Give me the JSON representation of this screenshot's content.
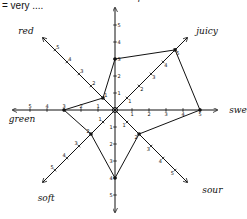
{
  "title": "= very ....",
  "chart_data": {
    "type": "radar",
    "title": "= very ....",
    "axes": [
      "crisp",
      "juicy",
      "sweet",
      "sour",
      "crunchy",
      "soft",
      "green",
      "red"
    ],
    "values": [
      3,
      5,
      5,
      2,
      4,
      2,
      3,
      1
    ],
    "range": [
      0,
      5
    ],
    "ticks": [
      1,
      2,
      3,
      4,
      5
    ],
    "grid": false,
    "legend": "none",
    "style": "hand-drawn"
  },
  "colors": {
    "ink": "#111111",
    "background": "#ffffff"
  }
}
